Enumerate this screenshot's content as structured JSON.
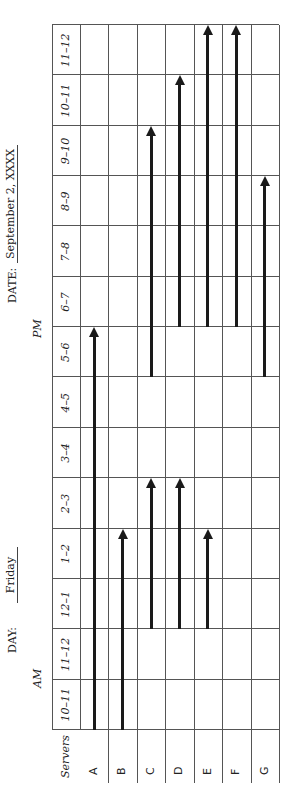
{
  "header": {
    "day_label": "DAY:",
    "day_value": "Friday",
    "date_label": "DATE:",
    "date_value": "September 2, XXXX",
    "am_label": "AM",
    "pm_label": "PM"
  },
  "table": {
    "row_header": "Servers",
    "time_slots": [
      "10–11",
      "11–12",
      "12–1",
      "1–2",
      "2–3",
      "3–4",
      "4–5",
      "5–6",
      "6–7",
      "7–8",
      "8–9",
      "9–10",
      "10–11",
      "11–12"
    ],
    "servers": [
      "A",
      "B",
      "C",
      "D",
      "E",
      "F",
      "G"
    ]
  },
  "shifts": [
    {
      "server": "A",
      "start_slot": 0,
      "end_slot": 8
    },
    {
      "server": "B",
      "start_slot": 0,
      "end_slot": 4
    },
    {
      "server": "C",
      "start_slot": 2,
      "end_slot": 5
    },
    {
      "server": "C",
      "start_slot": 7,
      "end_slot": 12
    },
    {
      "server": "D",
      "start_slot": 2,
      "end_slot": 5
    },
    {
      "server": "D",
      "start_slot": 8,
      "end_slot": 13
    },
    {
      "server": "E",
      "start_slot": 2,
      "end_slot": 4
    },
    {
      "server": "E",
      "start_slot": 8,
      "end_slot": 14
    },
    {
      "server": "F",
      "start_slot": 8,
      "end_slot": 14
    },
    {
      "server": "G",
      "start_slot": 7,
      "end_slot": 11
    }
  ],
  "colors": {
    "line": "#555555",
    "arrow": "#1a1a1a",
    "text": "#222222"
  }
}
